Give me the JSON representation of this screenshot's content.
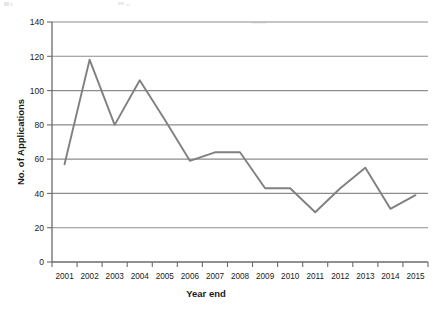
{
  "chart_data": {
    "type": "line",
    "title": "",
    "subtitle": "",
    "xlabel": "Year end",
    "ylabel": "No. of Applications",
    "categories": [
      "2001",
      "2002",
      "2003",
      "2004",
      "2005",
      "2006",
      "2007",
      "2008",
      "2009",
      "2010",
      "2011",
      "2012",
      "2013",
      "2014",
      "2015"
    ],
    "values": [
      57,
      118,
      80,
      106,
      83,
      59,
      64,
      64,
      43,
      43,
      29,
      43,
      55,
      31,
      39
    ],
    "series": [
      {
        "name": "No. of Applications",
        "values": [
          57,
          118,
          80,
          106,
          83,
          59,
          64,
          64,
          43,
          43,
          29,
          43,
          55,
          31,
          39
        ]
      }
    ],
    "ylim": [
      0,
      140
    ],
    "y_ticks": [
      0,
      20,
      40,
      60,
      80,
      100,
      120,
      140
    ],
    "y_tick_labels": [
      "0",
      "20",
      "40",
      "60",
      "80",
      "100",
      "120",
      "140"
    ],
    "x_tick_labels": [
      "2001",
      "2002",
      "2003",
      "2004",
      "2005",
      "2006",
      "2007",
      "2008",
      "2009",
      "2010",
      "2011",
      "2012",
      "2013",
      "2014",
      "2015"
    ],
    "grid": true,
    "grid_orientation": "horizontal",
    "legend": false,
    "legend_position": "none",
    "line_color": "#808080",
    "grid_color": "#8c8c8c",
    "axis_color": "#6b6b6b",
    "background_color": "#ffffff",
    "annotations": []
  },
  "axes": {
    "y_title": "No. of Applications",
    "x_title": "Year end"
  },
  "y_labels": {
    "t0": "0",
    "t20": "20",
    "t40": "40",
    "t60": "60",
    "t80": "80",
    "t100": "100",
    "t120": "120",
    "t140": "140"
  },
  "x_labels": {
    "y2001": "2001",
    "y2002": "2002",
    "y2003": "2003",
    "y2004": "2004",
    "y2005": "2005",
    "y2006": "2006",
    "y2007": "2007",
    "y2008": "2008",
    "y2009": "2009",
    "y2010": "2010",
    "y2011": "2011",
    "y2012": "2012",
    "y2013": "2013",
    "y2014": "2014",
    "y2015": "2015"
  }
}
